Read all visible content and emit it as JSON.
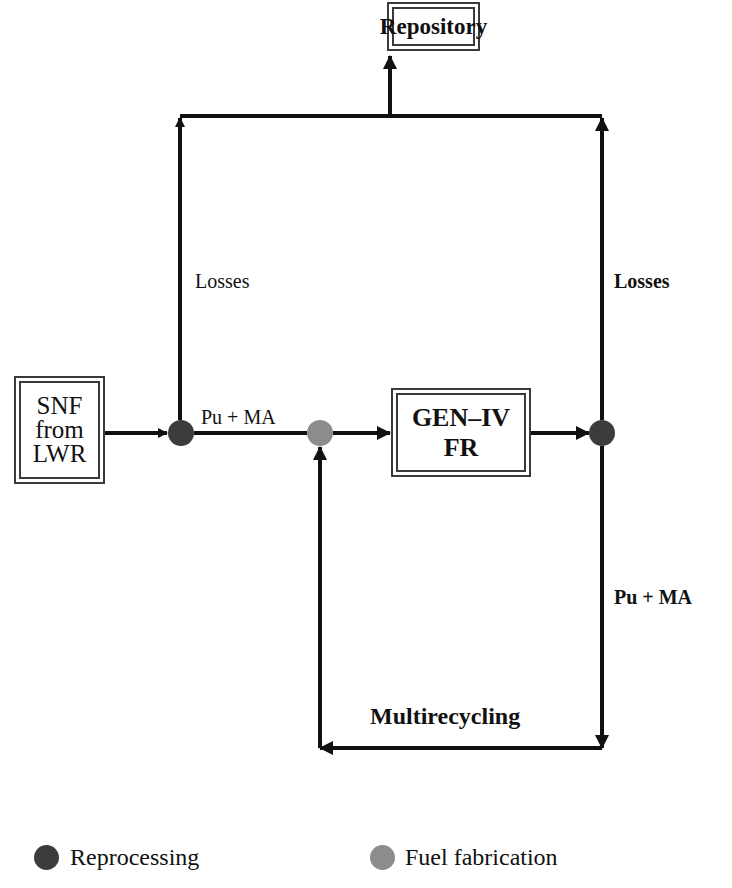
{
  "diagram": {
    "nodes": {
      "repository": {
        "label": "Repository"
      },
      "snf": {
        "lines": [
          "SNF",
          "from",
          "LWR"
        ]
      },
      "reactor": {
        "lines": [
          "GEN–IV",
          "FR"
        ]
      },
      "reprocessing_node_1": {
        "type": "reprocessing"
      },
      "fuel_fabrication_node": {
        "type": "fuel_fabrication"
      },
      "reprocessing_node_2": {
        "type": "reprocessing"
      }
    },
    "labels": {
      "losses_left": "Losses",
      "losses_right": "Losses",
      "pu_ma_main": "Pu + MA",
      "pu_ma_right": "Pu + MA",
      "multirecycling": "Multirecycling"
    },
    "edges": [
      {
        "from": "snf",
        "to": "reprocessing_node_1"
      },
      {
        "from": "reprocessing_node_1",
        "to": "fuel_fabrication_node",
        "label": "Pu + MA"
      },
      {
        "from": "reprocessing_node_1",
        "to": "repository",
        "label": "Losses"
      },
      {
        "from": "fuel_fabrication_node",
        "to": "reactor"
      },
      {
        "from": "reactor",
        "to": "reprocessing_node_2"
      },
      {
        "from": "reprocessing_node_2",
        "to": "repository",
        "label": "Losses"
      },
      {
        "from": "reprocessing_node_2",
        "to": "fuel_fabrication_node",
        "label": "Pu + MA / Multirecycling"
      }
    ],
    "colors": {
      "reprocessing": "#3c3c3c",
      "fuel_fabrication": "#8c8c8c",
      "line": "#111111"
    }
  },
  "legend": {
    "items": [
      {
        "label": "Reprocessing",
        "color": "#3c3c3c"
      },
      {
        "label": "Fuel fabrication",
        "color": "#8c8c8c"
      }
    ]
  }
}
